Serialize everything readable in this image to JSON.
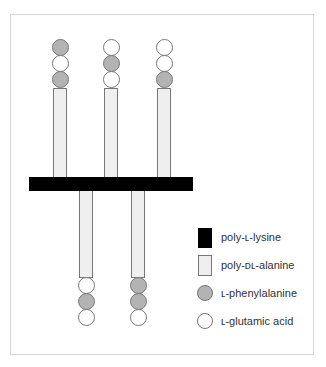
{
  "diagram": {
    "colors": {
      "backbone": "#000000",
      "rod_fill": "#efefef",
      "phenylalanine": "#b3b3b3",
      "glutamic": "#ffffff",
      "outline": "#777777"
    },
    "top_branches": [
      {
        "x": 60,
        "residues": [
          "phe",
          "glu",
          "phe"
        ]
      },
      {
        "x": 111,
        "residues": [
          "glu",
          "phe",
          "glu"
        ]
      },
      {
        "x": 164,
        "residues": [
          "glu",
          "glu",
          "phe"
        ]
      }
    ],
    "bottom_branches": [
      {
        "x": 86,
        "residues": [
          "glu",
          "phe",
          "glu"
        ]
      },
      {
        "x": 138,
        "residues": [
          "phe",
          "phe",
          "glu"
        ]
      }
    ]
  },
  "legend": {
    "items": [
      {
        "key": "poly-L-lysine",
        "label": "poly-ʟ-lysine",
        "swatch": "black-rect"
      },
      {
        "key": "poly-DL-alanine",
        "label": "poly-ᴅʟ-alanine",
        "swatch": "light-rect"
      },
      {
        "key": "L-phenylalanine",
        "label": "ʟ-phenylalanine",
        "swatch": "gray-circle"
      },
      {
        "key": "L-glutamic acid",
        "label": "ʟ-glutamic acid",
        "swatch": "white-circle"
      }
    ]
  }
}
